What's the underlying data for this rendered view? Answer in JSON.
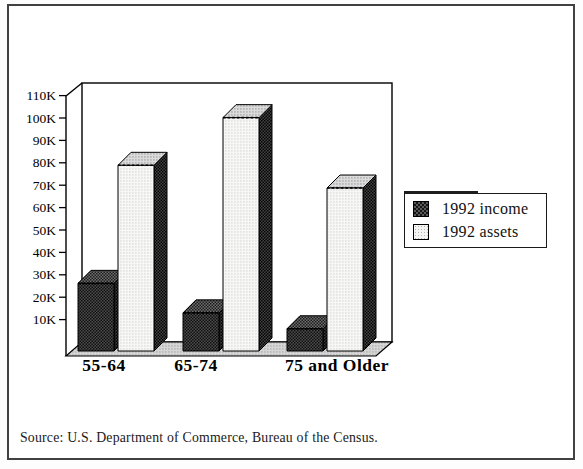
{
  "figure": {
    "background": "#ffffff",
    "border_color": "#414141",
    "bar_outline_color": "#000000",
    "income_pattern_color": "#2e2e2e",
    "assets_pattern_color": "#f2f2f2"
  },
  "chart_data": {
    "type": "bar",
    "style": "3d-perspective",
    "title": "",
    "xlabel": "",
    "ylabel": "",
    "grid": false,
    "legend_position": "right",
    "categories": [
      "55-64",
      "65-74",
      "75 and Older"
    ],
    "series": [
      {
        "name": "1992 income",
        "values": [
          32000,
          19000,
          12000
        ],
        "pattern": "dark-crosshatch"
      },
      {
        "name": "1992 assets",
        "values": [
          84000,
          105000,
          74000
        ],
        "pattern": "light-dots"
      }
    ],
    "values_unit": "US dollars",
    "ylim": [
      0,
      110000
    ],
    "yticks": [
      {
        "value": 10000,
        "label": "10K"
      },
      {
        "value": 20000,
        "label": "20K"
      },
      {
        "value": 30000,
        "label": "30K"
      },
      {
        "value": 40000,
        "label": "40K"
      },
      {
        "value": 50000,
        "label": "50K"
      },
      {
        "value": 60000,
        "label": "60K"
      },
      {
        "value": 70000,
        "label": "70K"
      },
      {
        "value": 80000,
        "label": "80K"
      },
      {
        "value": 90000,
        "label": "90K"
      },
      {
        "value": 100000,
        "label": "100K"
      },
      {
        "value": 110000,
        "label": "110K"
      }
    ]
  },
  "footer": {
    "source": "Source: U.S. Department of Commerce, Bureau of the Census."
  }
}
